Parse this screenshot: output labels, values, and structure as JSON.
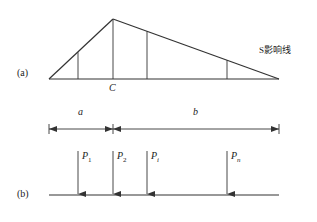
{
  "figure": {
    "part_a": {
      "label": "(a)",
      "influence_line_label": "S影响线",
      "point_label": "C",
      "dimension_a": "a",
      "dimension_b": "b"
    },
    "part_b": {
      "label": "(b)",
      "loads": [
        {
          "name": "P",
          "sub": "1"
        },
        {
          "name": "P",
          "sub": "2"
        },
        {
          "name": "P",
          "sub": "i"
        },
        {
          "name": "P",
          "sub": "n"
        }
      ]
    },
    "colors": {
      "line": "#333333",
      "text": "#222222",
      "background": "#ffffff"
    }
  }
}
